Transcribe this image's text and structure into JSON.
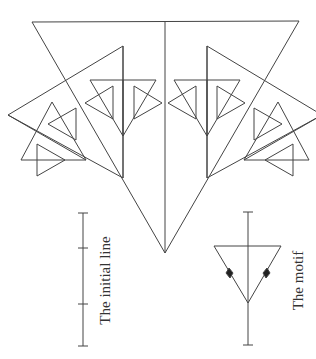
{
  "labels": {
    "initial_line": "The initial line",
    "motif": "The motif"
  },
  "colors": {
    "stroke": "#444444"
  },
  "figure": {
    "type": "fractal tree of triangles",
    "levels": 3
  }
}
